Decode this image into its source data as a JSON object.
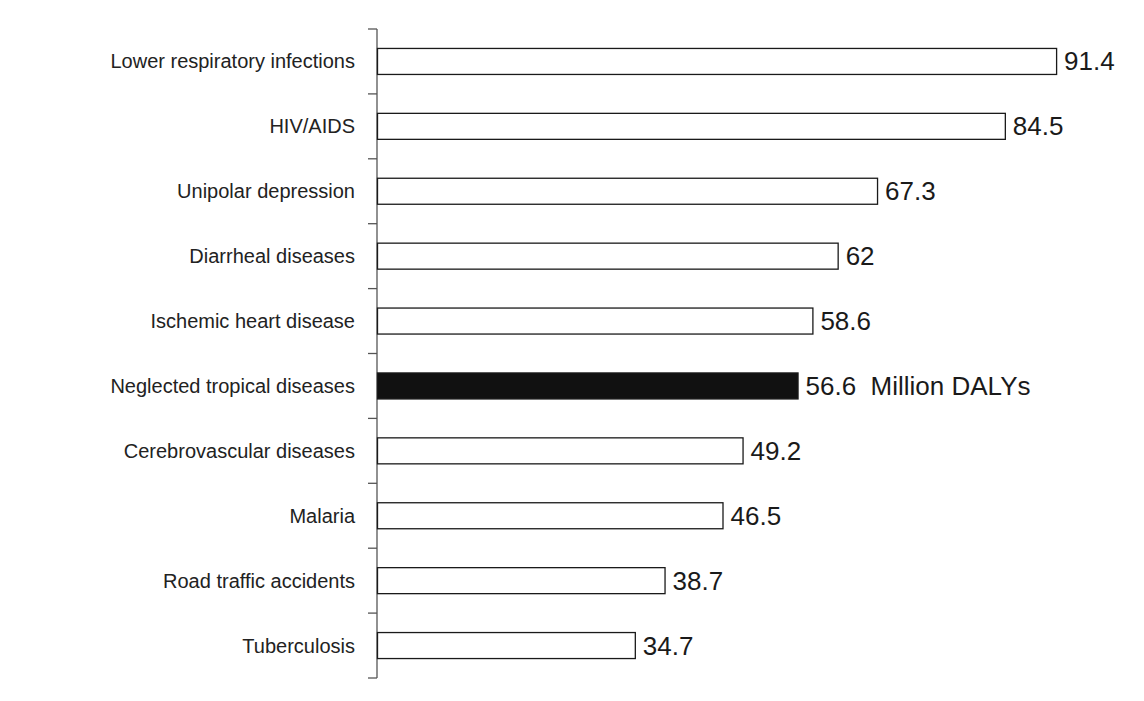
{
  "chart_data": {
    "type": "bar",
    "orientation": "horizontal",
    "title": "",
    "xlabel": "",
    "ylabel": "",
    "xlim": [
      0,
      92
    ],
    "grid": false,
    "legend": "none",
    "categories": [
      "Lower respiratory infections",
      "HIV/AIDS",
      "Unipolar depression",
      "Diarrheal diseases",
      "Ischemic heart disease",
      "Neglected tropical diseases",
      "Cerebrovascular diseases",
      "Malaria",
      "Road traffic accidents",
      "Tuberculosis"
    ],
    "values": [
      91.4,
      84.5,
      67.3,
      62,
      58.6,
      56.6,
      49.2,
      46.5,
      38.7,
      34.7
    ],
    "value_labels": [
      "91.4",
      "84.5",
      "67.3",
      "62",
      "58.6",
      "56.6  Million DALYs",
      "49.2",
      "46.5",
      "38.7",
      "34.7"
    ],
    "highlighted_index": 5,
    "units": "Million DALYs",
    "colors": {
      "bar_fill": "#ffffff",
      "bar_stroke": "#1a1a1a",
      "highlight_fill": "#111111",
      "axis": "#555555"
    }
  }
}
